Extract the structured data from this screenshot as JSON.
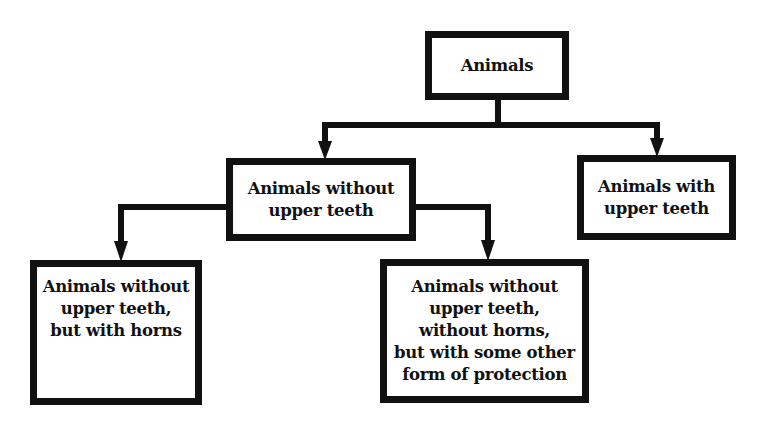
{
  "diagram": {
    "type": "classification-tree",
    "root": {
      "label": "Animals"
    },
    "level1": [
      {
        "label": "Animals without\nupper teeth"
      },
      {
        "label": "Animals with\nupper teeth"
      }
    ],
    "level2": [
      {
        "label": "Animals without\nupper teeth,\nbut with horns"
      },
      {
        "label": "Animals without\nupper teeth,\nwithout horns,\nbut with some other\nform of protection"
      }
    ],
    "edges": [
      {
        "from": "Animals",
        "to": "Animals without upper teeth"
      },
      {
        "from": "Animals",
        "to": "Animals with upper teeth"
      },
      {
        "from": "Animals without upper teeth",
        "to": "Animals without upper teeth, but with horns"
      },
      {
        "from": "Animals without upper teeth",
        "to": "Animals without upper teeth, without horns, but with some other form of protection"
      }
    ],
    "colors": {
      "line": "#111111",
      "background": "#ffffff"
    }
  }
}
